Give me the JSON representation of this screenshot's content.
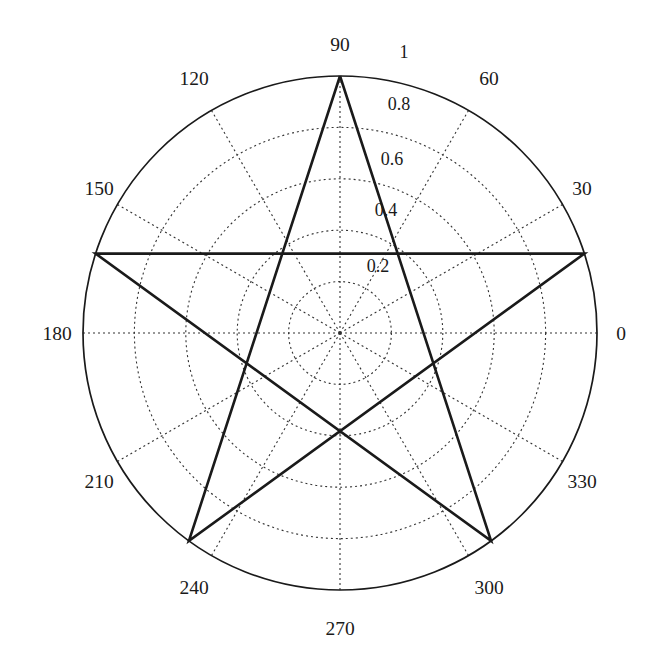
{
  "figure": {
    "background_color": "#ffffff",
    "line_color": "#1a1a1a",
    "grid_color": "#333333",
    "center_x": 340,
    "center_y": 333,
    "radius_px": 257
  },
  "chart_data": {
    "type": "line",
    "title": "",
    "subtitle": "",
    "xlabel": "",
    "ylabel": "",
    "projection": "polar",
    "angle_unit": "degrees",
    "theta_zero_location": "E",
    "theta_direction": "counterclockwise",
    "grid": true,
    "grid_style": "dotted",
    "legend": null,
    "rlim": [
      0,
      1
    ],
    "thetalim": [
      0,
      360
    ],
    "angular_tick_labels": [
      "0",
      "30",
      "60",
      "90",
      "120",
      "150",
      "180",
      "210",
      "240",
      "270",
      "300",
      "330"
    ],
    "angular_tick_values": [
      0,
      30,
      60,
      90,
      120,
      150,
      180,
      210,
      240,
      270,
      300,
      330
    ],
    "radial_tick_labels": [
      "0.2",
      "0.4",
      "0.6",
      "0.8",
      "1"
    ],
    "radial_tick_values": [
      0.2,
      0.4,
      0.6,
      0.8,
      1.0
    ],
    "radial_label_angle_deg": 75,
    "series": [
      {
        "name": "pentagram",
        "closed": true,
        "line_width": 2.6,
        "color": "#1a1a1a",
        "theta_deg": [
          90,
          234,
          18,
          162,
          306,
          90
        ],
        "r": [
          1,
          1,
          1,
          1,
          1,
          1
        ],
        "points": [
          {
            "theta_deg": 90,
            "r": 1
          },
          {
            "theta_deg": 234,
            "r": 1
          },
          {
            "theta_deg": 18,
            "r": 1
          },
          {
            "theta_deg": 162,
            "r": 1
          },
          {
            "theta_deg": 306,
            "r": 1
          },
          {
            "theta_deg": 90,
            "r": 1
          }
        ]
      }
    ],
    "annotations": []
  },
  "labels": {
    "angle": {
      "a0": "0",
      "a30": "30",
      "a60": "60",
      "a90": "90",
      "a120": "120",
      "a150": "150",
      "a180": "180",
      "a210": "210",
      "a240": "240",
      "a270": "270",
      "a300": "300",
      "a330": "330"
    },
    "radial": {
      "r02": "0.2",
      "r04": "0.4",
      "r06": "0.6",
      "r08": "0.8",
      "r10": "1"
    }
  }
}
